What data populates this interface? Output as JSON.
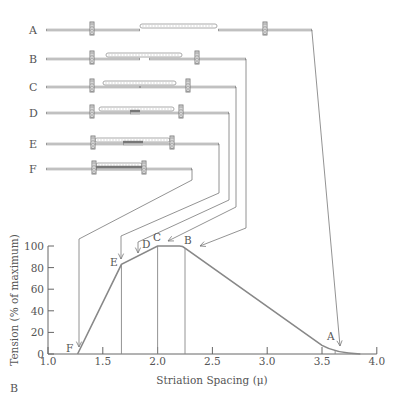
{
  "figure": {
    "panel_label": "B",
    "rows": [
      {
        "label": "A",
        "y": 30,
        "start": 46,
        "end": 312,
        "z_left": 92,
        "z_right": 265,
        "thick": [
          140,
          217
        ],
        "thin_left_end": 140,
        "thin_right_start": 218,
        "overlap": null
      },
      {
        "label": "B",
        "y": 59,
        "start": 46,
        "end": 246,
        "z_left": 92,
        "z_right": 197,
        "thick": [
          106,
          182
        ],
        "thin_left_end": 140,
        "thin_right_start": 149,
        "overlap": null
      },
      {
        "label": "C",
        "y": 87,
        "start": 46,
        "end": 236,
        "z_left": 92,
        "z_right": 188,
        "thick": [
          103,
          176
        ],
        "thin_left_end": 140,
        "thin_right_start": 140,
        "overlap": null
      },
      {
        "label": "D",
        "y": 113,
        "start": 46,
        "end": 229,
        "z_left": 92,
        "z_right": 181,
        "thick": [
          99,
          174
        ],
        "thin_left_end": 140,
        "thin_right_start": 130,
        "overlap": [
          130,
          140
        ]
      },
      {
        "label": "E",
        "y": 144,
        "start": 46,
        "end": 219,
        "z_left": 93,
        "z_right": 172,
        "thick": [
          95,
          170
        ],
        "thin_left_end": 143,
        "thin_right_start": 123,
        "overlap": [
          123,
          143
        ]
      },
      {
        "label": "F",
        "y": 169,
        "start": 46,
        "end": 192,
        "z_left": 94,
        "z_right": 144,
        "thick": [
          96,
          142
        ],
        "thin_left_end": 142,
        "thin_right_start": 96,
        "overlap": [
          96,
          142
        ]
      }
    ],
    "leaders": [
      {
        "to": "A",
        "points": [
          [
            312,
            30
          ],
          [
            312,
            32
          ],
          [
            340,
            346
          ]
        ]
      },
      {
        "to": "B",
        "points": [
          [
            246,
            59
          ],
          [
            246,
            228
          ],
          [
            200,
            246
          ]
        ]
      },
      {
        "to": "C",
        "points": [
          [
            236,
            87
          ],
          [
            236,
            207
          ],
          [
            168,
            241
          ]
        ]
      },
      {
        "to": "D",
        "points": [
          [
            229,
            113
          ],
          [
            229,
            200
          ],
          [
            138,
            242
          ],
          [
            138,
            253
          ]
        ]
      },
      {
        "to": "E",
        "points": [
          [
            219,
            144
          ],
          [
            219,
            193
          ],
          [
            121,
            236
          ],
          [
            121,
            259
          ]
        ]
      },
      {
        "to": "F",
        "points": [
          [
            192,
            169
          ],
          [
            192,
            180
          ],
          [
            79,
            239
          ],
          [
            79,
            347
          ]
        ]
      }
    ]
  },
  "chart_data": {
    "type": "line",
    "title": "",
    "xlabel": "Striation Spacing (μ)",
    "ylabel": "Tension (% of maximum)",
    "xlim": [
      1.0,
      4.0
    ],
    "ylim": [
      0,
      100
    ],
    "xticks": [
      "1.0",
      "1.5",
      "2.0",
      "2.5",
      "3.0",
      "3.5",
      "4.0"
    ],
    "yticks": [
      "0",
      "20",
      "40",
      "60",
      "80",
      "100"
    ],
    "grid": false,
    "legend": null,
    "series": [
      {
        "name": "Tension",
        "x": [
          1.27,
          1.67,
          2.0,
          2.2,
          2.25,
          3.5,
          3.65,
          3.85
        ],
        "y": [
          0,
          83,
          100,
          100,
          98,
          8,
          2,
          0
        ]
      }
    ],
    "annotations": [
      {
        "label": "A",
        "x": 3.65,
        "y": 2
      },
      {
        "label": "B",
        "x": 2.25,
        "y": 98
      },
      {
        "label": "C",
        "x": 2.0,
        "y": 100
      },
      {
        "label": "D",
        "x": 1.82,
        "y": 92
      },
      {
        "label": "E",
        "x": 1.67,
        "y": 83
      },
      {
        "label": "F",
        "x": 1.27,
        "y": 0
      }
    ],
    "vertical_lines_at_x": [
      1.67,
      2.0,
      2.25,
      3.62
    ]
  }
}
